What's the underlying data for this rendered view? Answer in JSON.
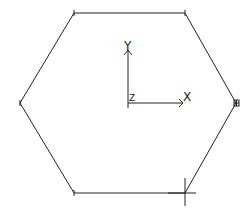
{
  "viewport": {
    "background": "#ffffff",
    "line_color": "#222222"
  },
  "hexagon": {
    "vertices": [
      [
        74,
        13
      ],
      [
        185,
        13
      ],
      [
        236,
        103
      ],
      [
        185,
        193
      ],
      [
        74,
        193
      ],
      [
        20,
        103
      ]
    ]
  },
  "ucs": {
    "origin": [
      128,
      103
    ],
    "x_label": "X",
    "y_label": "Y",
    "z_label": "Z"
  },
  "grip_marker": {
    "symbol": "⊞",
    "position": [
      236,
      103
    ]
  },
  "cursor": {
    "position": [
      185,
      186
    ]
  }
}
